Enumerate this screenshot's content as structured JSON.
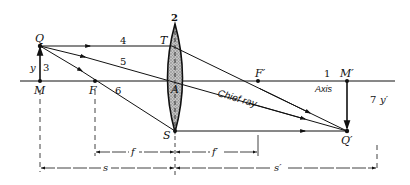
{
  "diagram": {
    "type": "thin-lens-ray-diagram",
    "points": {
      "Q": "Q",
      "M": "M",
      "F": "F",
      "A": "A",
      "T": "T",
      "S": "S",
      "F_prime": "F′",
      "M_prime": "M′",
      "Q_prime": "Q′"
    },
    "ray_numbers": {
      "axis": "1",
      "lens": "2",
      "object": "3",
      "ray4": "4",
      "ray5": "5",
      "ray6": "6",
      "image": "7"
    },
    "labels": {
      "axis": "Axis",
      "chief_ray": "Chief ray",
      "object_height": "y",
      "image_height": "y′"
    },
    "dimensions": {
      "f": "f",
      "f_prime": "f′",
      "s": "s",
      "s_prime": "s′"
    },
    "colors": {
      "line": "#111111",
      "lens_fill": "#b8b8b8"
    }
  }
}
